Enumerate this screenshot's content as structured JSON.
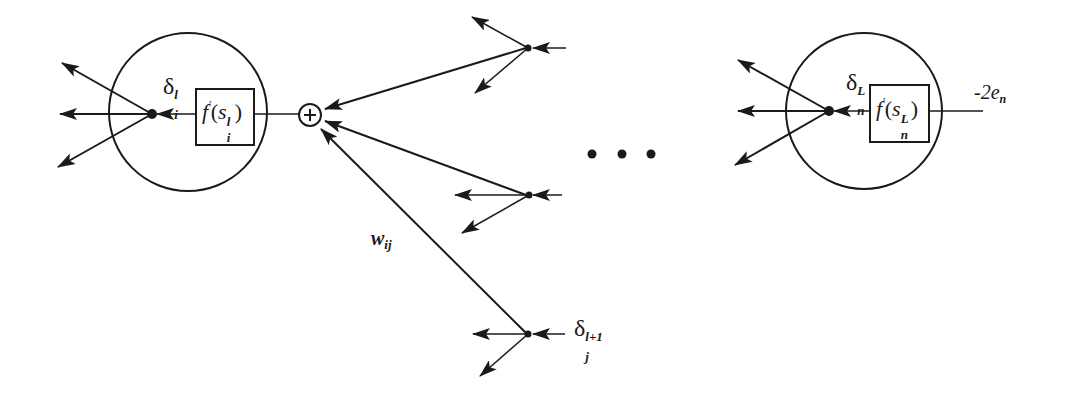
{
  "diagram": {
    "colors": {
      "stroke": "#1a1a1a",
      "background": "#ffffff"
    },
    "nodes": {
      "hidden_neuron": {
        "delta_symbol": "δ",
        "delta_sub": "i",
        "delta_sup": "l",
        "box_func": "f",
        "box_prime": "′",
        "box_arg": "s",
        "box_arg_sub": "i",
        "box_arg_sup": "l"
      },
      "output_neuron": {
        "delta_symbol": "δ",
        "delta_sub": "n",
        "delta_sup": "L",
        "box_func": "f",
        "box_prime": "′",
        "box_arg": "s",
        "box_arg_sub": "n",
        "box_arg_sup": "L",
        "input_label_main": "-2e",
        "input_label_sub": "n"
      },
      "summing_junction": {
        "symbol": "+"
      },
      "next_layer_node": {
        "delta_symbol": "δ",
        "delta_sub": "j",
        "delta_sup": "l+1"
      }
    },
    "edges": {
      "weight_label_main": "w",
      "weight_label_sub": "ij"
    },
    "ellipsis": "• • •"
  }
}
